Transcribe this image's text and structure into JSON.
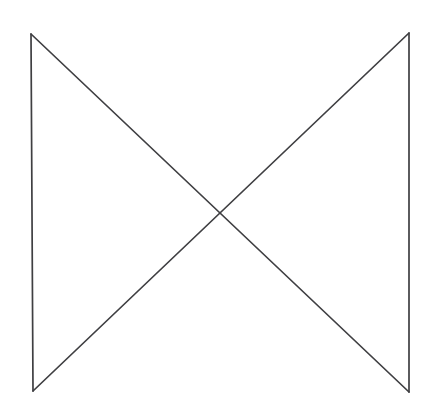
{
  "canvas": {
    "width": 437,
    "height": 420,
    "background_color": "#ffffff"
  },
  "figure": {
    "name": "bowtie-hourglass-outline",
    "stroke_color": "#3f3f42",
    "stroke_width": 1.7,
    "fill": "none"
  },
  "vertices": {
    "top_left": {
      "x": 31,
      "y": 34
    },
    "top_right": {
      "x": 409,
      "y": 33
    },
    "bottom_left": {
      "x": 33,
      "y": 391
    },
    "bottom_right": {
      "x": 409,
      "y": 392
    },
    "crossing_center": {
      "x": 220,
      "y": 223
    }
  },
  "segments": [
    {
      "name": "left-vertical-edge",
      "from": {
        "x": 31,
        "y": 34
      },
      "to": {
        "x": 33,
        "y": 391
      },
      "path": "M 31 34 L 33 391"
    },
    {
      "name": "right-vertical-edge",
      "from": {
        "x": 409,
        "y": 33
      },
      "to": {
        "x": 409,
        "y": 392
      },
      "path": "M 409 33 L 409 392"
    },
    {
      "name": "diagonal-top-left-to-bottom-right",
      "from": {
        "x": 31,
        "y": 34
      },
      "to": {
        "x": 409,
        "y": 392
      },
      "path": "M 31 34 L 409 392"
    },
    {
      "name": "diagonal-top-right-to-bottom-left",
      "from": {
        "x": 409,
        "y": 33
      },
      "to": {
        "x": 33,
        "y": 391
      },
      "path": "M 409 33 L 33 391"
    }
  ]
}
